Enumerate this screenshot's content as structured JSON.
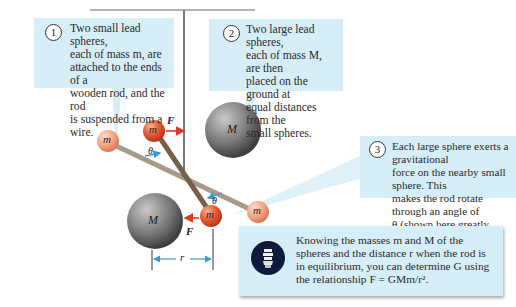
{
  "callouts": [
    {
      "number": "1",
      "text": "Two small lead spheres,\neach of mass m, are\nattached to the ends of a\nwooden rod, and the rod\nis suspended from a wire."
    },
    {
      "number": "2",
      "text": "Two large lead spheres,\neach of mass M, are then\nplaced on the ground at\nequal distances from the\nsmall spheres."
    },
    {
      "number": "3",
      "text": "Each large sphere exerts a gravitational\nforce on the nearby small sphere. This\nmakes the rod rotate through an angle of\nθ (shown here greatly exaggerated) and\ntwists the wire."
    }
  ],
  "tip": {
    "icon": "lightbulb-icon",
    "text": "Knowing the masses m and M of the\nspheres and the distance r when the rod is\nin equilibrium, you can determine G using\nthe relationship F = GMm/r²."
  },
  "labels": {
    "small_mass": "m",
    "large_mass": "M",
    "force": "F",
    "angle": "θ",
    "distance": "r"
  },
  "colors": {
    "callout_bg": "#d6eef8",
    "small_sphere": "#e8603a",
    "small_sphere_light": "#f2a07e",
    "large_sphere": "#6e6e6e",
    "rod": "#8a7a68",
    "force_arrow": "#d83a2a",
    "angle_arrow": "#3a9ad8",
    "bulb_bg": "#0f1a3a"
  }
}
